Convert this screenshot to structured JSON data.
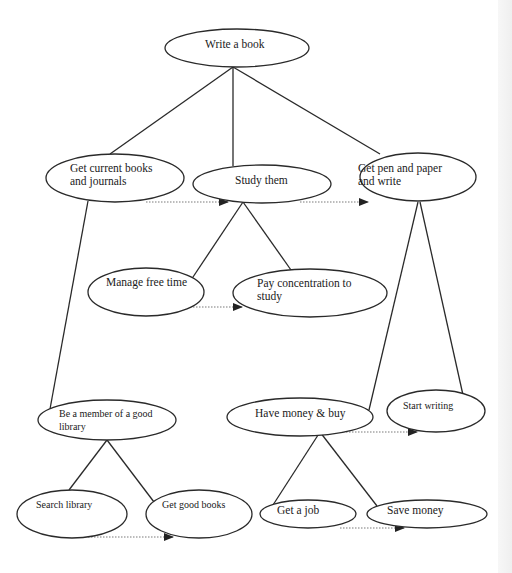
{
  "diagram": {
    "type": "tree",
    "title": "Write a book",
    "colors": {
      "line": "#2a2a2a",
      "dotted": "#7a7a7a",
      "arrowhead": "#222222",
      "background": "#ffffff"
    },
    "nodes": {
      "root": {
        "label_line1": "Write a book",
        "label_line2": ""
      },
      "books": {
        "label_line1": "Get current books",
        "label_line2": "and journals"
      },
      "study": {
        "label_line1": "Study them",
        "label_line2": ""
      },
      "pen": {
        "label_line1": "Get pen and paper",
        "label_line2": "and write"
      },
      "freetime": {
        "label_line1": "Manage free time",
        "label_line2": ""
      },
      "concentrate": {
        "label_line1": "Pay concentration to",
        "label_line2": "study"
      },
      "library": {
        "label_line1": "Be a member of a good",
        "label_line2": "library"
      },
      "money": {
        "label_line1": "Have money & buy",
        "label_line2": ""
      },
      "startwriting": {
        "label_line1": "Start writing",
        "label_line2": ""
      },
      "search": {
        "label_line1": "Search library",
        "label_line2": ""
      },
      "goodbooks": {
        "label_line1": "Get good books",
        "label_line2": ""
      },
      "job": {
        "label_line1": "Get a job",
        "label_line2": ""
      },
      "save": {
        "label_line1": "Save money",
        "label_line2": ""
      }
    },
    "edges": [
      [
        "Write a book",
        "Get current books and journals"
      ],
      [
        "Write a book",
        "Study them"
      ],
      [
        "Write a book",
        "Get pen and paper and write"
      ],
      [
        "Study them",
        "Manage free time"
      ],
      [
        "Study them",
        "Pay concentration to study"
      ],
      [
        "Get current books and journals",
        "Be a member of a good library"
      ],
      [
        "Get pen and paper and write",
        "Have money & buy"
      ],
      [
        "Get pen and paper and write",
        "Start writing"
      ],
      [
        "Be a member of a good library",
        "Search library"
      ],
      [
        "Be a member of a good library",
        "Get good books"
      ],
      [
        "Have money & buy",
        "Get a job"
      ],
      [
        "Have money & buy",
        "Save money"
      ]
    ],
    "sequence_arrows": [
      [
        "Get current books and journals",
        "Study them"
      ],
      [
        "Study them",
        "Get pen and paper and write"
      ],
      [
        "Manage free time",
        "Pay concentration to study"
      ],
      [
        "Have money & buy",
        "Start writing"
      ],
      [
        "Search library",
        "Get good books"
      ],
      [
        "Get a job",
        "Save money"
      ]
    ]
  }
}
